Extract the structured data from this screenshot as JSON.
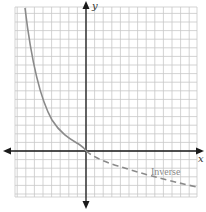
{
  "diagram": {
    "axis_labels": {
      "x": "x",
      "y": "y"
    },
    "curve_labels": {
      "dashed": "Inverse"
    },
    "colors": {
      "axis": "#1a1a1a",
      "grid": "#c8c8c8",
      "curve": "#8a8a8a"
    },
    "grid": {
      "columns": 21,
      "rows": 22
    }
  },
  "chart_data": {
    "type": "line",
    "title": "",
    "xlabel": "x",
    "ylabel": "y",
    "grid": true,
    "series": [
      {
        "name": "function (solid)",
        "style": "solid",
        "description": "Decreasing exponential-type curve approaching the origin from the upper left",
        "points": [
          [
            -7.2,
            16.8
          ],
          [
            -6,
            12
          ],
          [
            -5,
            8.5
          ],
          [
            -4,
            5.5
          ],
          [
            -3,
            3.5
          ],
          [
            -2,
            1.8
          ],
          [
            -1,
            0.6
          ],
          [
            0,
            0
          ]
        ]
      },
      {
        "name": "Inverse",
        "style": "dashed",
        "description": "Inverse function, decreasing logarithmic-type curve from the origin to the lower right",
        "points": [
          [
            0,
            0
          ],
          [
            2,
            -1.6
          ],
          [
            4,
            -2.4
          ],
          [
            6,
            -3
          ],
          [
            8,
            -3.4
          ],
          [
            10,
            -3.9
          ],
          [
            13,
            -4.2
          ]
        ]
      }
    ],
    "legend": [
      "Inverse"
    ]
  }
}
